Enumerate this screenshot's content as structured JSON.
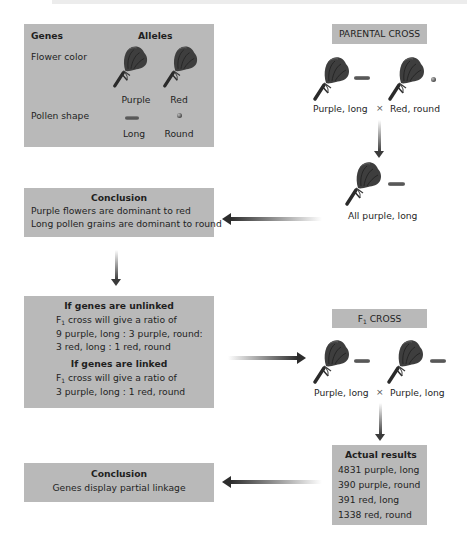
{
  "genes_box": {
    "header_genes": "Genes",
    "header_alleles": "Alleles",
    "rows": [
      {
        "gene": "Flower color",
        "allele_1": "Purple",
        "allele_2": "Red",
        "icon_1": "purple-flower-icon",
        "icon_2": "red-flower-icon"
      },
      {
        "gene": "Pollen shape",
        "allele_1": "Long",
        "allele_2": "Round",
        "icon_1": "long-pollen-icon",
        "icon_2": "round-pollen-icon"
      }
    ]
  },
  "parental_cross": {
    "label": "PARENTAL CROSS",
    "parent_1": "Purple, long",
    "cross_symbol": "×",
    "parent_2": "Red, round",
    "offspring": "All purple, long"
  },
  "conclusion_1": {
    "title": "Conclusion",
    "lines": [
      "Purple flowers are dominant to red",
      "Long pollen grains are dominant to round"
    ]
  },
  "predictions": {
    "unlinked": {
      "title": "If genes are unlinked",
      "line_1_prefix": "F",
      "line_1_sub": "1",
      "line_1_rest": " cross will give a ratio of",
      "line_2": "9 purple, long : 3 purple, round:",
      "line_3": "3 red, long : 1 red, round"
    },
    "linked": {
      "title": "If genes are linked",
      "line_1_prefix": "F",
      "line_1_sub": "1",
      "line_1_rest": " cross will give a ratio of",
      "line_2": "3 purple, long : 1 red, round"
    }
  },
  "f1_cross": {
    "label_prefix": "F",
    "label_sub": "1",
    "label_rest": " CROSS",
    "parent_1": "Purple, long",
    "cross_symbol": "×",
    "parent_2": "Purple, long"
  },
  "actual_results": {
    "title": "Actual results",
    "rows": [
      "4831 purple, long",
      "390 purple, round",
      "391 red, long",
      "1338 red, round"
    ]
  },
  "conclusion_2": {
    "title": "Conclusion",
    "line": "Genes display partial linkage"
  },
  "colors": {
    "box_fill": "#b9b9b9",
    "text": "#1f1f1f",
    "arrow": "#2c2c2c"
  }
}
